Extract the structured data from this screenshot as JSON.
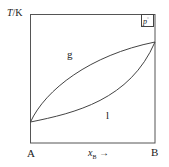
{
  "diagram": {
    "type": "phase-diagram",
    "y_axis_label": "T/K",
    "y_axis_var": "T",
    "y_axis_unit": "K",
    "x_axis_label": "x_B →",
    "x_axis_var": "x",
    "x_axis_sub": "B",
    "x_axis_arrow": "→",
    "left_component": "A",
    "right_component": "B",
    "pressure_label": "p°",
    "pressure_var": "p",
    "pressure_sup": "°",
    "regions": [
      {
        "name": "gas",
        "label": "g"
      },
      {
        "name": "liquid",
        "label": "l"
      }
    ],
    "curves": [
      {
        "name": "dew-point-curve",
        "description": "upper (vapour composition) curve"
      },
      {
        "name": "bubble-point-curve",
        "description": "lower (liquid composition) curve"
      }
    ],
    "colors": {
      "line": "#444444",
      "text": "#222222",
      "background": "#ffffff"
    }
  }
}
